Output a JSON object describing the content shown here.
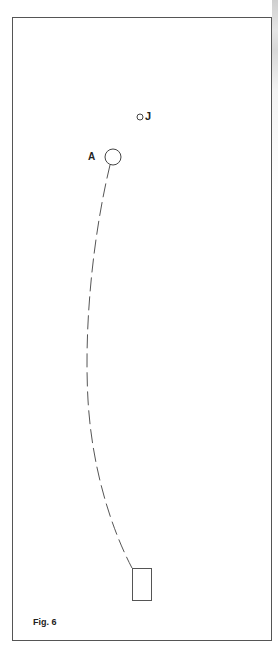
{
  "figure": {
    "caption": "Fig. 6",
    "frame": {
      "x": 12,
      "y": 17,
      "width": 259,
      "height": 623,
      "stroke": "#555555"
    },
    "points": [
      {
        "id": "A",
        "label": "A",
        "cx": 113,
        "cy": 157,
        "r": 8
      },
      {
        "id": "J",
        "label": "J",
        "cx": 140,
        "cy": 117,
        "r": 3
      }
    ],
    "path": {
      "style": "dashed",
      "from": "A",
      "to": "rectangle",
      "stroke": "#555555"
    },
    "rectangle": {
      "x": 132,
      "y": 568,
      "width": 19,
      "height": 32
    },
    "colors": {
      "ink": "#222222",
      "line": "#555555",
      "background": "#ffffff"
    }
  }
}
